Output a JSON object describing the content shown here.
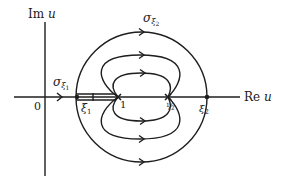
{
  "figure": {
    "type": "contour-diagram",
    "axes": {
      "horizontal_label": "Re u",
      "vertical_label": "Im u",
      "origin_label": "0"
    },
    "points": [
      {
        "id": "xi1",
        "label": "ξ₁",
        "sub": "1",
        "base": "ξ"
      },
      {
        "id": "one",
        "label": "1"
      },
      {
        "id": "half",
        "label": "½"
      },
      {
        "id": "xi2",
        "label": "ξ₂",
        "sub": "2",
        "base": "ξ"
      }
    ],
    "contours": [
      {
        "id": "sigma_xi1",
        "label": "σ_ξ₁",
        "base": "σ",
        "sub_base": "ξ",
        "sub_index": "1",
        "description": "path along real axis from 0 to ξ₁ with slit from ξ₁ to 1"
      },
      {
        "id": "sigma_xi2",
        "label": "σ_ξ₂",
        "base": "σ",
        "sub_base": "ξ",
        "sub_index": "2",
        "description": "outer circle through ξ₁ and ξ₂"
      }
    ],
    "flow_lines": [
      {
        "id": "outer",
        "description": "outer closed contour, arrows left-to-right on top and bottom"
      },
      {
        "id": "middle",
        "description": "middle loops from 1 to ½, arrows left-to-right"
      },
      {
        "id": "inner",
        "description": "inner loops from 1 to ½, arrows left-to-right"
      }
    ],
    "stroke_color": "#1e1e1e",
    "background_color": "#ffffff"
  }
}
